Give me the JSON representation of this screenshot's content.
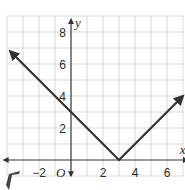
{
  "chart_data": {
    "type": "line",
    "title": "",
    "xlabel": "x",
    "ylabel": "y",
    "origin_label": "O",
    "xlim": [
      -4,
      7
    ],
    "ylim": [
      0,
      9
    ],
    "grid": true,
    "x_ticks": [
      -2,
      2,
      4,
      6
    ],
    "y_ticks": [
      2,
      4,
      6,
      8
    ],
    "x_tick_labels": [
      "−2",
      "2",
      "4",
      "6"
    ],
    "y_tick_labels": [
      "2",
      "4",
      "6",
      "8"
    ],
    "series": [
      {
        "name": "y = |x - 3|",
        "points": [
          [
            -3.8,
            6.8
          ],
          [
            3,
            0
          ],
          [
            7,
            4
          ]
        ],
        "color": "#333333",
        "arrows": "both"
      }
    ]
  }
}
